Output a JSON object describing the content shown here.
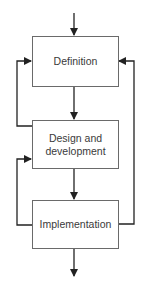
{
  "diagram": {
    "type": "flowchart",
    "colors": {
      "line": "#222222",
      "box_border": "#6a6a6a",
      "text": "#3a3a3a",
      "background": "#ffffff"
    },
    "nodes": [
      {
        "id": "definition",
        "label": "Definition"
      },
      {
        "id": "design",
        "label": "Design and\ndevelopment"
      },
      {
        "id": "implementation",
        "label": "Implementation"
      }
    ],
    "edges": [
      {
        "from": "input",
        "to": "definition"
      },
      {
        "from": "definition",
        "to": "design"
      },
      {
        "from": "design",
        "to": "implementation"
      },
      {
        "from": "implementation",
        "to": "output"
      },
      {
        "from": "design",
        "to": "definition",
        "kind": "feedback-left"
      },
      {
        "from": "implementation",
        "to": "design",
        "kind": "feedback-left"
      },
      {
        "from": "implementation",
        "to": "definition",
        "kind": "feedback-right"
      }
    ]
  }
}
